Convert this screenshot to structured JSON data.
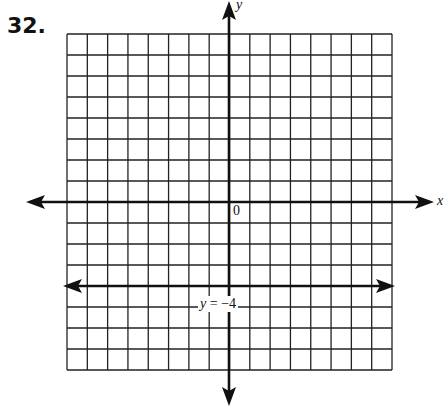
{
  "problem": {
    "number": "32."
  },
  "axes": {
    "x_label": "x",
    "y_label": "y",
    "origin_label": "0"
  },
  "line": {
    "label_var": "y",
    "label_eq": " = ",
    "label_val": "−4"
  },
  "colors": {
    "ink": "#111111",
    "grid": "#222222",
    "background": "#ffffff"
  },
  "chart_data": {
    "type": "line",
    "title": "32.",
    "xlabel": "x",
    "ylabel": "y",
    "xlim": [
      -8,
      8
    ],
    "ylim": [
      -8,
      8
    ],
    "grid": true,
    "grid_step": 1,
    "origin_label": "0",
    "series": [
      {
        "name": "y = -4",
        "equation": "y = -4",
        "x": [
          -8,
          8
        ],
        "y": [
          -4,
          -4
        ],
        "arrows": "both"
      }
    ],
    "annotations": [
      {
        "text": "y = −4",
        "x": -0.5,
        "y": -5
      }
    ]
  }
}
